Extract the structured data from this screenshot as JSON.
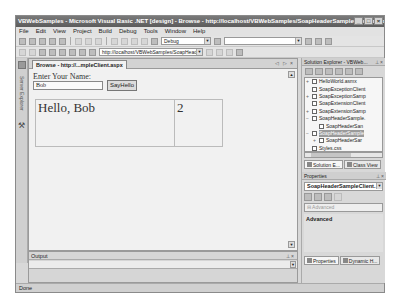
{
  "window": {
    "title": "VBWebSamples - Microsoft Visual Basic .NET [design] - Browse - http://localhost/VBWebSamples/SoapHeaderSampleClient.aspx",
    "controls": [
      "_",
      "□",
      "×"
    ]
  },
  "menu": [
    "File",
    "Edit",
    "View",
    "Project",
    "Build",
    "Debug",
    "Tools",
    "Window",
    "Help"
  ],
  "toolbar": {
    "config_combo": "Debug",
    "url": "http://localhost/VBWebSamples/SoapHead"
  },
  "toolbox": {
    "label": "Server Explorer"
  },
  "document": {
    "tab_label": "Browse - http://...mpleClient.aspx",
    "tab_controls": "◁ ▷ ×",
    "prompt": "Enter Your Name:",
    "name_value": "Bob",
    "button_label": "SayHello",
    "greeting": "Hello, Bob",
    "count": "2"
  },
  "output": {
    "title": "Output",
    "controls": "⊥ ×"
  },
  "solution_explorer": {
    "title": "Solution Explorer - VBWeb...",
    "controls": "⊥ ×",
    "items": [
      {
        "exp": "+",
        "label": "HelloWorld.asmx",
        "indent": 0
      },
      {
        "exp": "",
        "label": "SoapExceptionClient",
        "indent": 0
      },
      {
        "exp": "+",
        "label": "SoapExceptionSamp",
        "indent": 0
      },
      {
        "exp": "",
        "label": "SoapExtensionClient",
        "indent": 0
      },
      {
        "exp": "+",
        "label": "SoapExtensionSamp",
        "indent": 0
      },
      {
        "exp": "−",
        "label": "SoapHeaderSample.",
        "indent": 0
      },
      {
        "exp": "",
        "label": "SoapHeaderSan",
        "indent": 1
      },
      {
        "exp": "−",
        "label": "SoapHeaderSample",
        "indent": 0,
        "selected": true
      },
      {
        "exp": "+",
        "label": "SoapHeaderSar",
        "indent": 1
      },
      {
        "exp": "",
        "label": "Styles.css",
        "indent": 0
      },
      {
        "exp": "",
        "label": "VBWebSamples.vsdi",
        "indent": 0
      },
      {
        "exp": "",
        "label": "Web.config",
        "indent": 0
      }
    ],
    "tabs": [
      "Solution E...",
      "Class View"
    ]
  },
  "properties": {
    "title": "Properties",
    "controls": "⊥ ×",
    "object": "SoapHeaderSampleClient.",
    "category": "⊟ Advanced",
    "description_title": "Advanced",
    "tabs": [
      "Properties",
      "Dynamic H..."
    ]
  },
  "status": {
    "text": "Done"
  }
}
